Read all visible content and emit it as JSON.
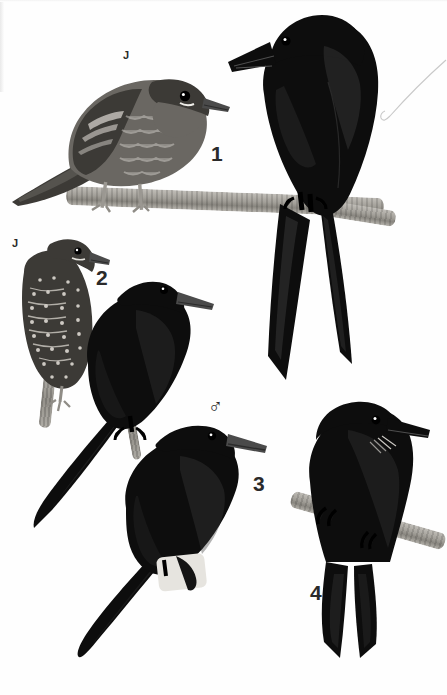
{
  "plate": {
    "kind": "field-guide-illustration-plate",
    "background_color": "#ffffff",
    "ink_color": "#0d0d0d",
    "label_color": "#2a2a2a",
    "branch_color": "#a9a69f",
    "width": 447,
    "height": 695
  },
  "labels": {
    "juvenile_1": "J",
    "juvenile_2": "J",
    "number_1": "1",
    "number_2": "2",
    "number_3": "3",
    "number_4": "4",
    "male_symbol": "♂"
  },
  "figures": [
    {
      "id": "fig-1-juvenile",
      "number": "1",
      "marker": "J",
      "pose": "perched on horizontal branch, facing right, scaled/mottled juvenile plumage",
      "perch": "horizontal branch"
    },
    {
      "id": "fig-1-adult",
      "number": "1",
      "marker": "",
      "pose": "perched upright on horizontal branch, facing left, glossy black, long deeply forked tail",
      "perch": "horizontal branch"
    },
    {
      "id": "fig-2-juvenile",
      "number": "2",
      "marker": "J",
      "pose": "perched on vertical twig, facing right, heavily spotted and barred underparts",
      "perch": "vertical twig"
    },
    {
      "id": "fig-2-adult",
      "number": "2",
      "marker": "",
      "pose": "perched facing right, all black, long tail angled down-left",
      "perch": "thin twig"
    },
    {
      "id": "fig-3-adult-male",
      "number": "3",
      "marker": "♂",
      "pose": "perched facing right on pale stub, all black, long graduated tail to lower-left",
      "perch": "pale stub"
    },
    {
      "id": "fig-4-adult",
      "number": "4",
      "marker": "",
      "pose": "perched on angled branch, facing right, rictal bristles, forked tail hanging down",
      "perch": "angled branch"
    }
  ],
  "annotations": {
    "hairline": "thin hooked pointer line at upper right"
  }
}
